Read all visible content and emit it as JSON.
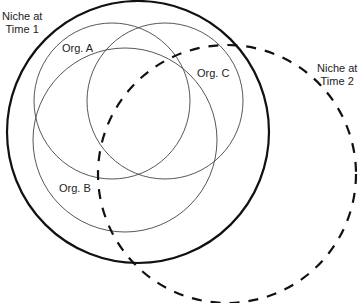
{
  "diagram": {
    "type": "niche-overlap",
    "niches": [
      {
        "id": "time1",
        "label": "Niche at\nTime 1",
        "style": "solid-thick",
        "cx": 138,
        "cy": 132,
        "r": 131
      },
      {
        "id": "time2",
        "label": "Niche at\nTime 2",
        "style": "dashed-thick",
        "cx": 227,
        "cy": 174,
        "r": 129
      }
    ],
    "organisms": [
      {
        "id": "A",
        "label": "Org. A",
        "cx": 112,
        "cy": 101,
        "r": 78
      },
      {
        "id": "B",
        "label": "Org. B",
        "cx": 125,
        "cy": 140,
        "r": 92
      },
      {
        "id": "C",
        "label": "Org. C",
        "cx": 165,
        "cy": 101,
        "r": 78
      }
    ],
    "colors": {
      "stroke": "#111111",
      "thin_stroke": "#444444",
      "background": "#ffffff"
    }
  }
}
